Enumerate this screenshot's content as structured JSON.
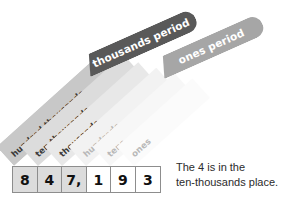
{
  "diagram": {
    "background_color": "#ffffff",
    "periods": [
      {
        "id": "thousands-period",
        "label": "thousands period",
        "color": "#595959",
        "text_color": "#ffffff"
      },
      {
        "id": "ones-period",
        "label": "ones period",
        "color": "#a6a6a6",
        "text_color": "#ffffff"
      }
    ],
    "place_columns": [
      {
        "id": "hundred-thousands",
        "label": "hundred thousands",
        "band_color": "#c8c8c8",
        "text_color": "#3a3a3a"
      },
      {
        "id": "ten-thousands",
        "label": "ten thousands",
        "band_color": "#dcdcdc",
        "text_color": "#3a3a3a"
      },
      {
        "id": "thousands",
        "label": "thousands",
        "band_color": "#e8e8e8",
        "text_color": "#3a3a3a"
      },
      {
        "id": "hundreds",
        "label": "hundreds",
        "band_color": "#f2f2f2",
        "text_color": "#b0b0b0"
      },
      {
        "id": "tens",
        "label": "tens",
        "band_color": "#f7f7f7",
        "text_color": "#b0b0b0"
      },
      {
        "id": "ones",
        "label": "ones",
        "band_color": "#fbfbfb",
        "text_color": "#b0b0b0"
      }
    ],
    "number": {
      "digits": [
        {
          "value": "8",
          "place": "hundred-thousands",
          "shaded": true
        },
        {
          "value": "4",
          "place": "ten-thousands",
          "shaded": true
        },
        {
          "value": "7,",
          "place": "thousands",
          "shaded": true
        },
        {
          "value": "1",
          "place": "hundreds",
          "shaded": false
        },
        {
          "value": "9",
          "place": "tens",
          "shaded": false
        },
        {
          "value": "3",
          "place": "ones",
          "shaded": false
        }
      ],
      "shaded_cell_color": "#dcdcdc",
      "plain_cell_color": "#ffffff",
      "border_color": "#8d8d8d"
    },
    "caption": {
      "line1": "The 4 is in the",
      "line2": "ten-thousands place."
    }
  }
}
